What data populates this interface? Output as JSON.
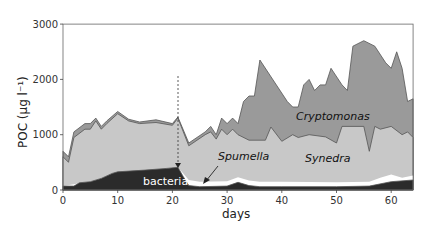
{
  "chart_data": {
    "type": "area",
    "title": "",
    "xlabel": "days",
    "ylabel": "POC (µg l⁻¹)",
    "xlim": [
      0,
      64
    ],
    "ylim": [
      0,
      3000
    ],
    "xticks": [
      0,
      10,
      20,
      30,
      40,
      50,
      60
    ],
    "yticks": [
      0,
      1000,
      2000,
      3000
    ],
    "stacked": true,
    "note": "values are cumulative tops of stacked areas",
    "series": [
      {
        "name": "bacteria",
        "color": "#2b2b2b",
        "x": [
          0,
          2,
          3,
          5,
          7,
          9,
          10,
          15,
          19,
          21,
          22,
          23,
          25,
          30,
          32,
          34,
          36,
          40,
          50,
          56,
          60,
          64
        ],
        "values": [
          70,
          70,
          130,
          150,
          210,
          300,
          330,
          360,
          390,
          410,
          240,
          80,
          60,
          70,
          140,
          80,
          60,
          60,
          60,
          70,
          150,
          180
        ]
      },
      {
        "name": "Spumella",
        "color": "#ffffff",
        "x": [
          0,
          21,
          22,
          23,
          25,
          30,
          32,
          34,
          36,
          40,
          50,
          56,
          58,
          60,
          62,
          64
        ],
        "values": [
          70,
          410,
          300,
          180,
          150,
          160,
          230,
          170,
          150,
          150,
          140,
          150,
          220,
          280,
          220,
          260
        ]
      },
      {
        "name": "Synedra",
        "color": "#c8c8c8",
        "x": [
          0,
          1,
          2,
          4,
          5,
          6,
          7,
          8,
          10,
          12,
          14,
          17,
          20,
          21,
          23,
          26,
          27,
          28,
          29,
          30,
          31,
          32,
          34,
          37,
          38,
          40,
          42,
          43,
          45,
          48,
          50,
          51,
          55,
          56,
          57,
          58,
          60,
          62,
          63,
          64
        ],
        "values": [
          600,
          500,
          950,
          1100,
          1100,
          1250,
          1100,
          1200,
          1380,
          1250,
          1200,
          1220,
          1170,
          1300,
          800,
          1000,
          1050,
          920,
          1100,
          1000,
          1100,
          1000,
          900,
          900,
          1140,
          880,
          1000,
          950,
          1000,
          960,
          850,
          1150,
          1150,
          700,
          1150,
          1100,
          1150,
          1000,
          1050,
          950
        ]
      },
      {
        "name": "Cryptomonas",
        "color": "#9a9a9a",
        "x": [
          0,
          1,
          2,
          4,
          5,
          6,
          7,
          8,
          10,
          12,
          14,
          17,
          20,
          21,
          23,
          26,
          27,
          28,
          29,
          30,
          31,
          32,
          33,
          34,
          35,
          36,
          41,
          42,
          43,
          44,
          45,
          46,
          47,
          48,
          49,
          51,
          52,
          53,
          55,
          57,
          59,
          60,
          61,
          62,
          63,
          64
        ],
        "values": [
          700,
          600,
          1050,
          1200,
          1200,
          1300,
          1150,
          1250,
          1420,
          1280,
          1230,
          1270,
          1200,
          1320,
          850,
          1050,
          1150,
          1000,
          1300,
          1200,
          1300,
          1200,
          1600,
          1700,
          1700,
          2350,
          1600,
          1500,
          1500,
          1900,
          2000,
          1800,
          1900,
          1900,
          2200,
          1900,
          1800,
          2600,
          2700,
          2600,
          2300,
          2200,
          2500,
          2200,
          1600,
          1650
        ]
      }
    ],
    "annotations": [
      {
        "text": "bacteria",
        "x": 15,
        "y": 200
      },
      {
        "text": "Spumella",
        "x": 29,
        "y": 650,
        "arrow_to": [
          26,
          120
        ]
      },
      {
        "text": "Synedra",
        "x": 50,
        "y": 620
      },
      {
        "text": "Cryptomonas",
        "x": 47,
        "y": 1400
      },
      {
        "text": "dashed arrow at day 21",
        "x": 21,
        "y_from": 2050,
        "y_to": 420
      }
    ]
  },
  "labels": {
    "bacteria": "bacteria",
    "spumella": "Spumella",
    "synedra": "Synedra",
    "cryptomonas": "Cryptomonas",
    "xlabel": "days",
    "ylabel": "POC (µg l⁻¹)"
  }
}
